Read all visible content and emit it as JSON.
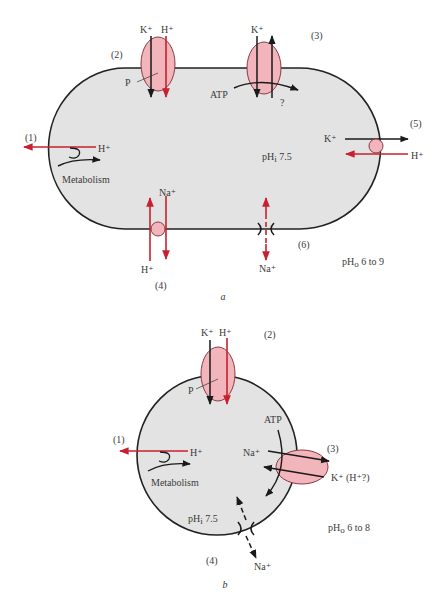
{
  "colors": {
    "cytoplasm": "#e3e3e3",
    "membrane": "#222222",
    "transporter_fill": "#f2b5bb",
    "transporter_stroke": "#8a3a44",
    "proton_arrow": "#c8202e",
    "black_arrow": "#1a1a1a"
  },
  "panel_a": {
    "caption": "a",
    "shape": "rod",
    "intracellular_ph": "pHᵢ 7.5",
    "extracellular_ph": "pHₒ 6 to 9",
    "systems": [
      {
        "id": "(1)",
        "label": "Metabolism",
        "ion": "H⁺",
        "direction": "out"
      },
      {
        "id": "(2)",
        "ions": [
          "K⁺",
          "H⁺"
        ],
        "driver": "P",
        "direction": "in"
      },
      {
        "id": "(3)",
        "ions": [
          "K⁺"
        ],
        "driver": "ATP",
        "unknown": "?"
      },
      {
        "id": "(4)",
        "ions": [
          "Na⁺",
          "H⁺"
        ],
        "type": "antiporter"
      },
      {
        "id": "(5)",
        "ions": [
          "K⁺",
          "H⁺"
        ],
        "type": "antiporter"
      },
      {
        "id": "(6)",
        "ions": [
          "Na⁺"
        ],
        "type": "channel"
      }
    ],
    "labels": {
      "n1": "(1)",
      "n2": "(2)",
      "n3": "(3)",
      "n4": "(4)",
      "n5": "(5)",
      "n6": "(6)",
      "h_plus": "H⁺",
      "k_plus": "K⁺",
      "na_plus": "Na⁺",
      "metabolism": "Metabolism",
      "atp": "ATP",
      "p": "P",
      "question": "?",
      "phi": "pH",
      "phi_sub": "i",
      "phi_val": " 7.5",
      "pho": "pH",
      "pho_sub": "o",
      "pho_val": " 6 to 9"
    }
  },
  "panel_b": {
    "caption": "b",
    "shape": "sphere",
    "intracellular_ph": "pHᵢ 7.5",
    "extracellular_ph": "pHₒ 6 to 8",
    "systems": [
      {
        "id": "(1)",
        "label": "Metabolism",
        "ion": "H⁺",
        "direction": "out"
      },
      {
        "id": "(2)",
        "ions": [
          "K⁺",
          "H⁺"
        ],
        "driver": "P",
        "direction": "in"
      },
      {
        "id": "(3)",
        "ions": [
          "Na⁺",
          "K⁺ (H⁺?)"
        ],
        "driver": "ATP"
      },
      {
        "id": "(4)",
        "ions": [
          "Na⁺"
        ],
        "type": "channel"
      }
    ],
    "labels": {
      "n1": "(1)",
      "n2": "(2)",
      "n3": "(3)",
      "n4": "(4)",
      "h_plus": "H⁺",
      "k_plus": "K⁺",
      "na_plus": "Na⁺",
      "k_hq": "K⁺ (H⁺?)",
      "metabolism": "Metabolism",
      "atp": "ATP",
      "p": "P",
      "phi": "pH",
      "phi_sub": "i",
      "phi_val": " 7.5",
      "pho": "pH",
      "pho_sub": "o",
      "pho_val": " 6 to 8"
    }
  }
}
